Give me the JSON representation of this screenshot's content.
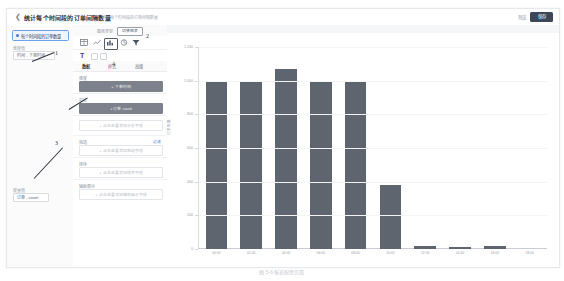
{
  "header": {
    "back_icon": "chevron-left-icon",
    "title": "统计每个时间段的订单间隔数量",
    "subtitle": "统计每个时间段的订单间隔数量",
    "save_text": "预览",
    "primary_button": "保存"
  },
  "left_panel": {
    "selected_card": "每个时间段的订单数量",
    "groups": [
      {
        "title": "维度值",
        "chip": "时间 - 下单时间"
      },
      {
        "title": "度量值",
        "chip": "订单 - count"
      }
    ]
  },
  "config_panel": {
    "topbar": {
      "label": "图表类型",
      "button": "切换图表"
    },
    "chart_icons": [
      "table-icon",
      "line-chart-icon",
      "bar-chart-icon",
      "pie-chart-icon",
      "funnel-icon"
    ],
    "selected_chart_icon": "bar-chart-icon",
    "text_tool_icon": "text-tool-icon",
    "tabs": [
      {
        "label": "数据",
        "active": true
      },
      {
        "label": "样式",
        "active": false
      },
      {
        "label": "高级",
        "active": false
      }
    ],
    "fields": [
      {
        "label": "维度",
        "value": "+ 下单时间",
        "filled": true,
        "link": ""
      },
      {
        "label": "指标",
        "value": "+ 订单 count",
        "filled": true,
        "link": ""
      },
      {
        "label": "",
        "value": "+ 点击这里添加分析字段",
        "filled": false,
        "link": ""
      },
      {
        "label": "筛选",
        "value": "+ 点击这里添加筛选字段",
        "filled": false,
        "link": "过滤"
      },
      {
        "label": "排序",
        "value": "+ 点击这里添加排序字段",
        "filled": false,
        "link": ""
      },
      {
        "label": "辅助展示",
        "value": "+ 点击这里添加辅助展示字段",
        "filled": false,
        "link": ""
      }
    ]
  },
  "callouts": [
    {
      "number": "1"
    },
    {
      "number": "2"
    },
    {
      "number": "3"
    },
    {
      "number": "4"
    }
  ],
  "figure_caption": "图 5-6  报表配置页面",
  "chart_data": {
    "type": "bar",
    "title": "",
    "xlabel": "",
    "ylabel": "订单数量",
    "categories": [
      "00:00",
      "02:00",
      "04:00",
      "06:00",
      "08:00",
      "10:00",
      "12:00",
      "14:00",
      "16:00",
      "18:00"
    ],
    "values": [
      1000,
      1000,
      1070,
      990,
      1000,
      380,
      15,
      12,
      20,
      0
    ],
    "ylim": [
      0,
      1200
    ],
    "yticks": [
      0,
      200,
      400,
      600,
      800,
      1000,
      1200
    ],
    "ytick_labels": [
      "0",
      "200",
      "400",
      "600",
      "800",
      "1,000",
      "1,200"
    ],
    "grid": true,
    "legend": "none",
    "bar_color": "#5f656f"
  }
}
